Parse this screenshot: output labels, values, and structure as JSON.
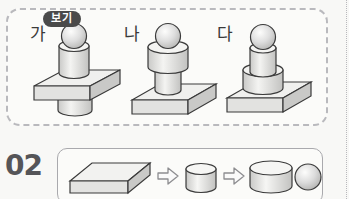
{
  "worksheet": {
    "example_panel": {
      "badge_label": "보기",
      "figures": [
        {
          "label": "가",
          "name": "figure-ga",
          "stack_description": "sphere on cylinder on rectangular prism with cylinder below",
          "parts": [
            "sphere",
            "cylinder",
            "rectangular-prism",
            "cylinder"
          ]
        },
        {
          "label": "나",
          "name": "figure-na",
          "stack_description": "sphere on wide cylinder on narrow cylinder on rectangular prism",
          "parts": [
            "sphere",
            "wide-cylinder",
            "narrow-cylinder",
            "rectangular-prism"
          ]
        },
        {
          "label": "다",
          "name": "figure-da",
          "stack_description": "sphere on narrow cylinder on wide cylinder on rectangular prism",
          "parts": [
            "sphere",
            "narrow-cylinder",
            "wide-cylinder",
            "rectangular-prism"
          ]
        }
      ]
    },
    "question": {
      "number": "02",
      "sequence": [
        {
          "shape": "rectangular-prism",
          "name": "seq-shape-box"
        },
        {
          "shape": "narrow-cylinder",
          "name": "seq-shape-cylinder-small"
        },
        {
          "shape": "wide-cylinder",
          "name": "seq-shape-cylinder-large"
        },
        {
          "shape": "sphere",
          "name": "seq-shape-sphere"
        }
      ],
      "arrow_glyph": "⇨",
      "arrow_count": 3
    }
  },
  "colors": {
    "page_background": "#f8f8f6",
    "panel_background": "#fbfbf9",
    "dashed_border": "#b9b9bd",
    "solid_border": "#a9a9ad",
    "badge_background": "#4a4a4a",
    "badge_text": "#ffffff",
    "shape_outline": "#3a3a3a",
    "shape_light": "#f2f2f0",
    "shape_mid": "#d9d9d7",
    "shape_dark": "#bdbdbb",
    "number_text": "#555558",
    "label_text": "#3a3a3a"
  }
}
